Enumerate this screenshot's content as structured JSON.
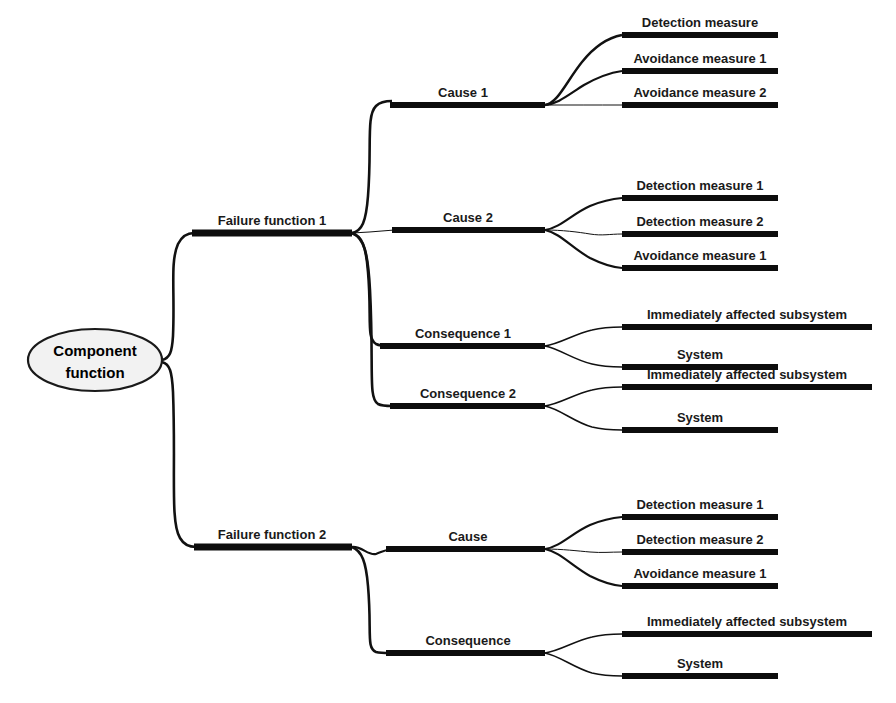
{
  "diagram": {
    "type": "mind-map",
    "colors": {
      "line": "#111111",
      "bar": "#0d0d0d",
      "root_fill": "#f2f2f2",
      "root_stroke": "#1a1a1a",
      "text": "#1a1a1a",
      "background": "#ffffff"
    },
    "root": {
      "label_line1": "Component",
      "label_line2": "function",
      "label_full": "Component function"
    },
    "level1": [
      {
        "id": "ff1",
        "label": "Failure function 1"
      },
      {
        "id": "ff2",
        "label": "Failure function 2"
      }
    ],
    "level2": [
      {
        "id": "ff1-cause1",
        "parent": "ff1",
        "label": "Cause 1"
      },
      {
        "id": "ff1-cause2",
        "parent": "ff1",
        "label": "Cause 2"
      },
      {
        "id": "ff1-cons1",
        "parent": "ff1",
        "label": "Consequence 1"
      },
      {
        "id": "ff1-cons2",
        "parent": "ff1",
        "label": "Consequence 2"
      },
      {
        "id": "ff2-cause",
        "parent": "ff2",
        "label": "Cause"
      },
      {
        "id": "ff2-cons",
        "parent": "ff2",
        "label": "Consequence"
      }
    ],
    "level3": [
      {
        "id": "l3-1",
        "parent": "ff1-cause1",
        "label": "Detection measure"
      },
      {
        "id": "l3-2",
        "parent": "ff1-cause1",
        "label": "Avoidance measure 1"
      },
      {
        "id": "l3-3",
        "parent": "ff1-cause1",
        "label": "Avoidance measure 2"
      },
      {
        "id": "l3-4",
        "parent": "ff1-cause2",
        "label": "Detection measure 1"
      },
      {
        "id": "l3-5",
        "parent": "ff1-cause2",
        "label": "Detection measure 2"
      },
      {
        "id": "l3-6",
        "parent": "ff1-cause2",
        "label": "Avoidance measure 1"
      },
      {
        "id": "l3-7",
        "parent": "ff1-cons1",
        "label": "Immediately affected subsystem"
      },
      {
        "id": "l3-8",
        "parent": "ff1-cons1",
        "label": "System"
      },
      {
        "id": "l3-9",
        "parent": "ff1-cons2",
        "label": "Immediately affected subsystem"
      },
      {
        "id": "l3-10",
        "parent": "ff1-cons2",
        "label": "System"
      },
      {
        "id": "l3-11",
        "parent": "ff2-cause",
        "label": "Detection measure 1"
      },
      {
        "id": "l3-12",
        "parent": "ff2-cause",
        "label": "Detection measure 2"
      },
      {
        "id": "l3-13",
        "parent": "ff2-cause",
        "label": "Avoidance measure 1"
      },
      {
        "id": "l3-14",
        "parent": "ff2-cons",
        "label": "Immediately affected subsystem"
      },
      {
        "id": "l3-15",
        "parent": "ff2-cons",
        "label": "System"
      }
    ]
  }
}
